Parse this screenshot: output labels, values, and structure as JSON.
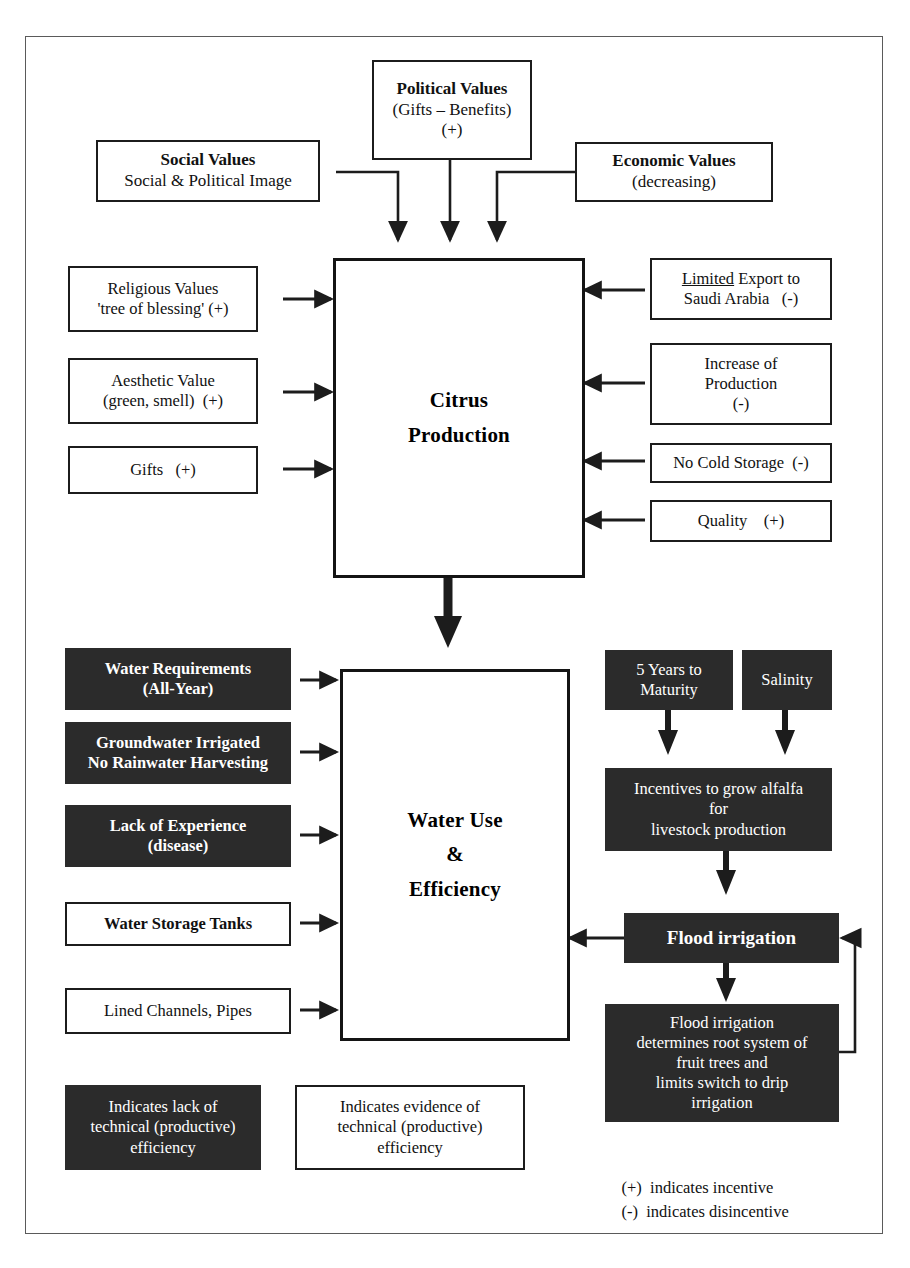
{
  "diagram": {
    "colors": {
      "dark_fill": "#2b2b2b",
      "light_fill": "#ffffff",
      "stroke": "#1c1c1c",
      "frame": "#5a5a5a"
    },
    "top_inputs": [
      {
        "name": "social-values",
        "lines": [
          "Social Values",
          "Social & Political Image"
        ],
        "bold": [
          true,
          false
        ],
        "style": "light"
      },
      {
        "name": "political-values",
        "lines": [
          "Political Values",
          "(Gifts – Benefits)",
          "(+)"
        ],
        "bold": [
          true,
          false,
          false
        ],
        "style": "light"
      },
      {
        "name": "economic-values",
        "lines": [
          "Economic Values",
          "(decreasing)"
        ],
        "bold": [
          true,
          false
        ],
        "style": "light"
      }
    ],
    "citrus_hub": {
      "lines": [
        "Citrus",
        "Production"
      ]
    },
    "citrus_left_inputs": [
      {
        "name": "religious-values",
        "lines": [
          "Religious Values",
          "'tree of blessing' (+)"
        ],
        "style": "light"
      },
      {
        "name": "aesthetic-value",
        "lines": [
          "Aesthetic Value",
          "(green, smell)  (+)"
        ],
        "style": "light"
      },
      {
        "name": "gifts",
        "lines": [
          "Gifts   (+)"
        ],
        "style": "light"
      }
    ],
    "citrus_right_inputs": [
      {
        "name": "limited-export",
        "lines": [
          "Limited Export to",
          "Saudi Arabia   (-)"
        ],
        "underline_first_word": true,
        "style": "light"
      },
      {
        "name": "increase-of-production",
        "lines": [
          "Increase of",
          "Production",
          "(-)"
        ],
        "style": "light"
      },
      {
        "name": "no-cold-storage",
        "lines": [
          "No Cold Storage  (-)"
        ],
        "style": "light"
      },
      {
        "name": "quality",
        "lines": [
          "Quality    (+)"
        ],
        "style": "light"
      }
    ],
    "water_hub": {
      "lines": [
        "Water Use",
        "&",
        "Efficiency"
      ]
    },
    "water_left_inputs": [
      {
        "name": "water-requirements",
        "lines": [
          "Water Requirements",
          "(All-Year)"
        ],
        "style": "dark",
        "bold": true
      },
      {
        "name": "groundwater-irrigated",
        "lines": [
          "Groundwater Irrigated",
          "No Rainwater Harvesting"
        ],
        "style": "dark",
        "bold": true
      },
      {
        "name": "lack-of-experience",
        "lines": [
          "Lack of Experience",
          "(disease)"
        ],
        "style": "dark",
        "bold": true
      },
      {
        "name": "water-storage-tanks",
        "lines": [
          "Water Storage Tanks"
        ],
        "style": "light",
        "bold": true
      },
      {
        "name": "lined-channels-pipes",
        "lines": [
          "Lined Channels, Pipes"
        ],
        "style": "light",
        "bold": false
      }
    ],
    "water_right_chain": [
      {
        "name": "five-years-to-maturity",
        "lines": [
          "5 Years to",
          "Maturity"
        ],
        "style": "dark"
      },
      {
        "name": "salinity",
        "lines": [
          "Salinity"
        ],
        "style": "dark"
      },
      {
        "name": "incentives-alfalfa",
        "lines": [
          "Incentives to grow alfalfa",
          "for",
          "livestock production"
        ],
        "style": "dark"
      },
      {
        "name": "flood-irrigation",
        "lines": [
          "Flood irrigation"
        ],
        "style": "dark",
        "bold": true
      },
      {
        "name": "flood-irrigation-effects",
        "lines": [
          "Flood irrigation",
          "determines root system of",
          "fruit trees and",
          "limits switch to drip",
          "irrigation"
        ],
        "style": "dark"
      }
    ],
    "legend": {
      "dark_key": {
        "name": "legend-dark",
        "lines": [
          "Indicates lack of",
          "technical (productive)",
          "efficiency"
        ],
        "style": "dark"
      },
      "light_key": {
        "name": "legend-light",
        "lines": [
          "Indicates evidence of",
          "technical (productive)",
          "efficiency"
        ],
        "style": "light"
      },
      "notes": [
        "(+)  indicates incentive",
        "(-)  indicates disincentive"
      ]
    }
  }
}
